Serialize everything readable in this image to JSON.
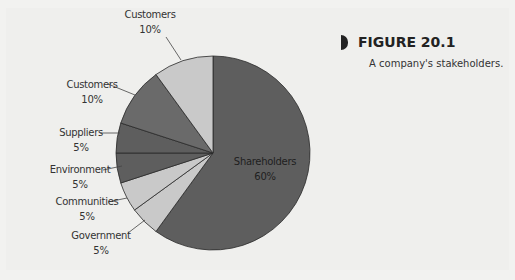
{
  "figure": {
    "label": "FIGURE 20.1",
    "caption": "A company's stakeholders."
  },
  "labels": {
    "customers_a": {
      "name": "Customers",
      "pct": "10%"
    },
    "customers_b": {
      "name": "Customers",
      "pct": "10%"
    },
    "suppliers": {
      "name": "Suppliers",
      "pct": "5%"
    },
    "environment": {
      "name": "Environment",
      "pct": "5%"
    },
    "communities": {
      "name": "Communities",
      "pct": "5%"
    },
    "government": {
      "name": "Government",
      "pct": "5%"
    },
    "shareholders": {
      "name": "Shareholders",
      "pct": "60%"
    }
  },
  "chart_data": {
    "type": "pie",
    "title": "FIGURE 20.1",
    "subtitle": "A company's stakeholders.",
    "categories": [
      "Shareholders",
      "Government",
      "Communities",
      "Environment",
      "Suppliers",
      "Customers",
      "Customers"
    ],
    "values": [
      60,
      5,
      5,
      5,
      5,
      10,
      10
    ],
    "unit": "%",
    "colors": [
      "#5e5e5e",
      "#c9c9c9",
      "#c9c9c9",
      "#5e5e5e",
      "#5e5e5e",
      "#6a6a6a",
      "#c9c9c9"
    ],
    "start_angle_deg": 0,
    "direction": "clockwise",
    "legend": "none (inline labels)"
  }
}
